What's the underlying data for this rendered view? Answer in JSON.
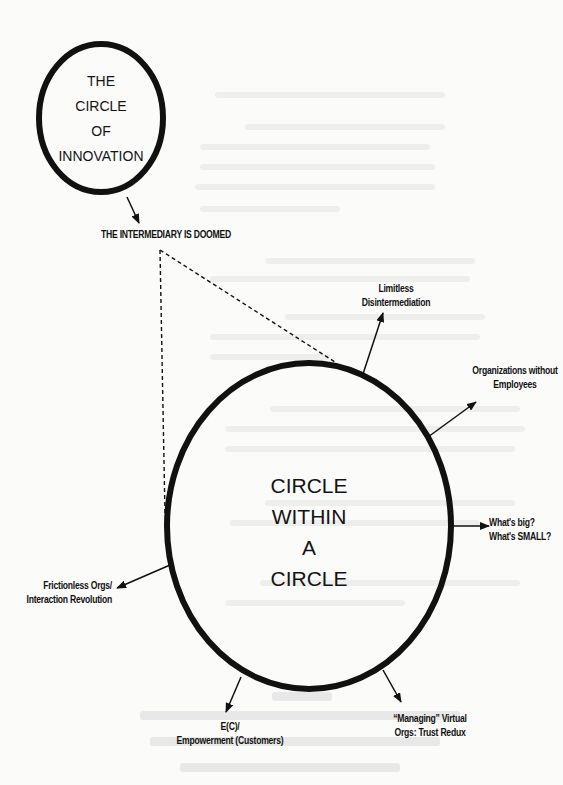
{
  "diagram": {
    "small_circle": {
      "lines": [
        "THE",
        "CIRCLE",
        "OF",
        "INNOVATION"
      ]
    },
    "big_circle": {
      "lines": [
        "CIRCLE",
        "WITHIN",
        "A",
        "CIRCLE"
      ]
    },
    "labels": {
      "intermediary": "THE INTERMEDIARY IS DOOMED",
      "limitless": [
        "Limitless",
        "Disintermediation"
      ],
      "orgs_without": [
        "Organizations without",
        "Employees"
      ],
      "whats_big": [
        "What's big?",
        "What's SMALL?"
      ],
      "frictionless": [
        "Frictionless Orgs/",
        "Interaction Revolution"
      ],
      "empowerment": [
        "E(C)/",
        "Empowerment (Customers)"
      ],
      "managing": [
        "“Managing” Virtual",
        "Orgs: Trust Redux"
      ]
    },
    "colors": {
      "ink": "#111111",
      "paper": "#fbfbfa",
      "bleed_through": "#ebebea"
    }
  }
}
